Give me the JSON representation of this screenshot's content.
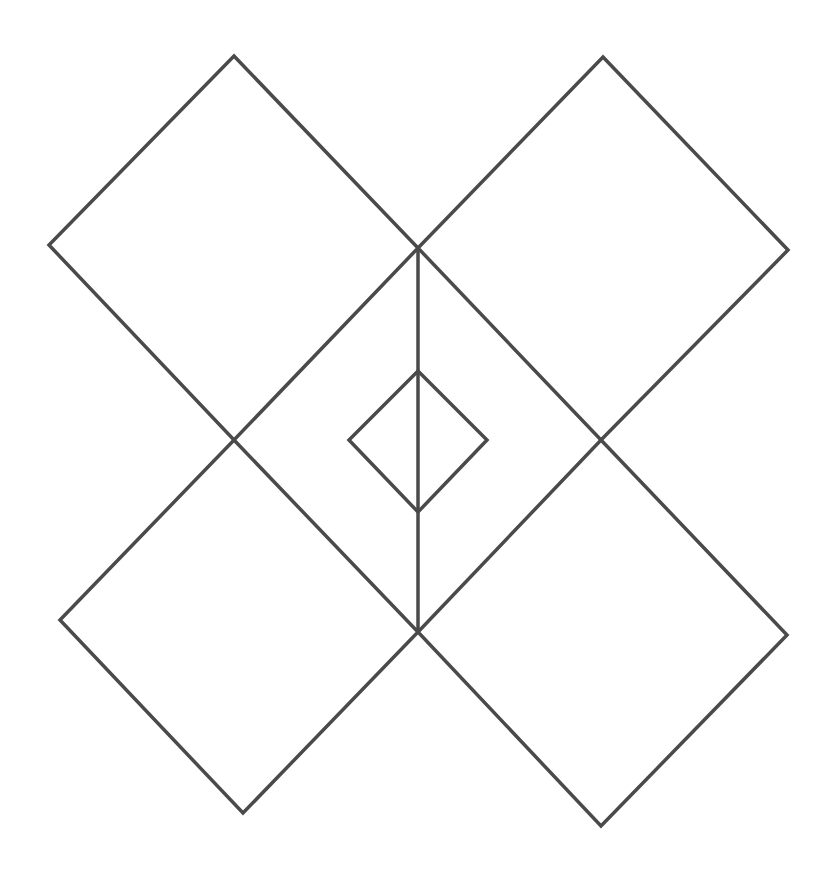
{
  "figure": {
    "width": 835,
    "height": 873,
    "background": "#ffffff",
    "stroke_color": "#4a4a4a",
    "stroke_width": 3.5
  },
  "shapes": {
    "diamonds": [
      {
        "name": "diamond-top-left",
        "points": [
          [
            234,
            56
          ],
          [
            418,
            248
          ],
          [
            234,
            440
          ],
          [
            49,
            245
          ]
        ]
      },
      {
        "name": "diamond-top-right",
        "points": [
          [
            603,
            57
          ],
          [
            788,
            250
          ],
          [
            601,
            440
          ],
          [
            418,
            248
          ]
        ]
      },
      {
        "name": "diamond-bottom-left",
        "points": [
          [
            234,
            440
          ],
          [
            418,
            632
          ],
          [
            243,
            813
          ],
          [
            60,
            620
          ]
        ]
      },
      {
        "name": "diamond-bottom-right",
        "points": [
          [
            601,
            440
          ],
          [
            787,
            635
          ],
          [
            601,
            826
          ],
          [
            418,
            632
          ]
        ]
      },
      {
        "name": "diamond-center-small",
        "points": [
          [
            418,
            371
          ],
          [
            487,
            440
          ],
          [
            418,
            512
          ],
          [
            349,
            440
          ]
        ]
      }
    ],
    "lines": [
      {
        "name": "vertical-axis-line",
        "x1": 418,
        "y1": 248,
        "x2": 418,
        "y2": 632
      }
    ]
  }
}
